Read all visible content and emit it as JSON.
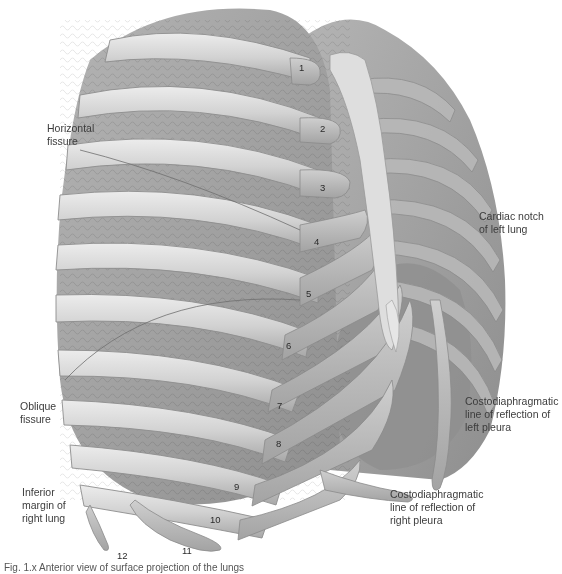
{
  "figure": {
    "colors": {
      "background": "#ffffff",
      "rib": "#cfcfcf",
      "rib_highlight": "#e4e4e4",
      "rib_shadow": "#9a9a9a",
      "lung": "#a6a6a6",
      "lung_dark": "#8c8c8c",
      "heart": "#8f8f8f",
      "cartilage": "#bdbdbd",
      "sternum": "#dedede",
      "label_text": "#3c3c3c"
    },
    "labels": {
      "horizontal_fissure": "Horizontal\nfissure",
      "cardiac_notch": "Cardiac notch\nof left lung",
      "costodiaphragmatic_left": "Costodiaphragmatic\nline of reflection of\nleft pleura",
      "oblique_fissure": "Oblique\nfissure",
      "costodiaphragmatic_right": "Costodiaphragmatic\nline of reflection of\nright pleura",
      "inferior_margin": "Inferior\nmargin of\nright lung"
    },
    "rib_numbers": [
      "1",
      "2",
      "3",
      "4",
      "5",
      "6",
      "7",
      "8",
      "9",
      "10",
      "11",
      "12"
    ],
    "caption": "Fig. 1.x  Anterior view of surface projection of the lungs"
  }
}
